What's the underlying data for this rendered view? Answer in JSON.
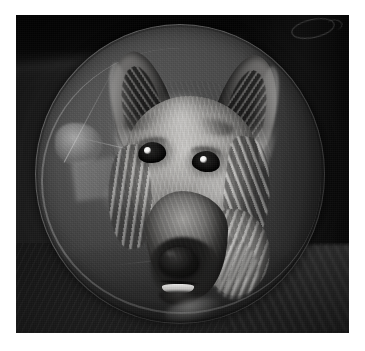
{
  "page": {
    "background_color": "#ffffff",
    "margins_px": {
      "left": 16,
      "top": 15,
      "right": 16,
      "bottom": 18
    }
  },
  "photo": {
    "subject": "dog-wearing-elizabethan-cone-collar",
    "description": "Close-up monochrome photograph of a long-haired German Shepherd type dog whose head fills a large translucent plastic Elizabethan recovery cone",
    "rendering": "grayscale",
    "width_px": 333,
    "height_px": 318,
    "background_color": "#1a1a1a"
  },
  "scene": {
    "background_label": "dark-room-background",
    "top_right_object_label": "faint-oval-object",
    "bottom_right_object_label": "textured-blanket",
    "floor_label": "dark-floor-surface"
  },
  "cone": {
    "label": "elizabethan-collar",
    "shape": "ellipse",
    "material": "translucent-plastic",
    "fill_color": "#4a4a4a",
    "rim_color": "#c8c8c8",
    "highlight_color": "#ebebeb",
    "features": [
      "rim-highlight",
      "molded-seam-lines",
      "specular-glare-patch",
      "surface-smudge"
    ]
  },
  "dog": {
    "label": "dog-head",
    "coat_light_color": "#cfc6b4",
    "coat_mid_color": "#8d8474",
    "coat_dark_color": "#2b271f",
    "parts": [
      {
        "name": "ear-left",
        "label": "Left ear"
      },
      {
        "name": "ear-right",
        "label": "Right ear"
      },
      {
        "name": "forehead",
        "label": "Forehead"
      },
      {
        "name": "eye-left",
        "label": "Left eye"
      },
      {
        "name": "eye-right",
        "label": "Right eye"
      },
      {
        "name": "muzzle",
        "label": "Muzzle"
      },
      {
        "name": "nose",
        "label": "Nose"
      },
      {
        "name": "mouth",
        "label": "Mouth"
      },
      {
        "name": "neck-ruff",
        "label": "Neck ruff"
      }
    ],
    "eye_catchlight_color": "#ffffff",
    "nose_color": "#17140f"
  }
}
